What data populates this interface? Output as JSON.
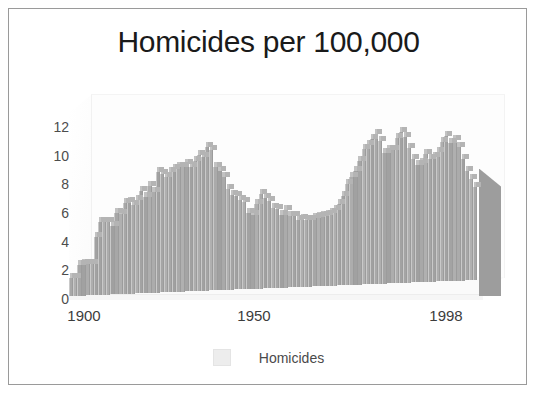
{
  "chart_data": {
    "type": "bar",
    "title": "Homicides per 100,000",
    "xlabel": "",
    "ylabel": "",
    "ylim": [
      0,
      13
    ],
    "yticks": [
      0,
      2,
      4,
      6,
      8,
      10,
      12
    ],
    "xticks": [
      "1900",
      "1950",
      "1998"
    ],
    "grid": false,
    "legend": {
      "position": "bottom",
      "entries": [
        "Homicides"
      ]
    },
    "style": "3d-bar",
    "bar_color": "#ababab",
    "bar_top_color": "#c2c2c2",
    "legend_swatch_color": "#ededed",
    "title_color": "#1a1a1a",
    "axis_text_color": "#4d4d4d",
    "frame_color": "#9a9a9a",
    "series": [
      {
        "name": "Homicides",
        "x": [
          1900,
          1901,
          1902,
          1903,
          1904,
          1905,
          1906,
          1907,
          1908,
          1909,
          1910,
          1911,
          1912,
          1913,
          1914,
          1915,
          1916,
          1917,
          1918,
          1919,
          1920,
          1921,
          1922,
          1923,
          1924,
          1925,
          1926,
          1927,
          1928,
          1929,
          1930,
          1931,
          1932,
          1933,
          1934,
          1935,
          1936,
          1937,
          1938,
          1939,
          1940,
          1941,
          1942,
          1943,
          1944,
          1945,
          1946,
          1947,
          1948,
          1949,
          1950,
          1951,
          1952,
          1953,
          1954,
          1955,
          1956,
          1957,
          1958,
          1959,
          1960,
          1961,
          1962,
          1963,
          1964,
          1965,
          1966,
          1967,
          1968,
          1969,
          1970,
          1971,
          1972,
          1973,
          1974,
          1975,
          1976,
          1977,
          1978,
          1979,
          1980,
          1981,
          1982,
          1983,
          1984,
          1985,
          1986,
          1987,
          1988,
          1989,
          1990,
          1991,
          1992,
          1993,
          1994,
          1995,
          1996,
          1997,
          1998
        ],
        "values": [
          1.2,
          1.2,
          2.1,
          2.1,
          2.1,
          2.1,
          3.9,
          4.9,
          4.9,
          4.9,
          4.6,
          5.5,
          5.4,
          6.1,
          6.2,
          6.0,
          6.3,
          6.9,
          6.5,
          7.2,
          6.8,
          8.1,
          8.0,
          7.8,
          8.1,
          8.3,
          8.4,
          8.4,
          8.6,
          8.4,
          8.8,
          9.2,
          9.0,
          9.7,
          9.5,
          8.3,
          8.0,
          7.6,
          6.8,
          6.4,
          6.3,
          6.0,
          5.9,
          5.1,
          5.0,
          5.7,
          6.4,
          6.1,
          5.9,
          5.4,
          5.3,
          4.9,
          5.2,
          4.8,
          4.8,
          4.5,
          4.6,
          4.5,
          4.5,
          4.6,
          4.7,
          4.7,
          4.8,
          4.9,
          5.1,
          5.5,
          6.0,
          6.8,
          7.3,
          7.7,
          8.3,
          9.1,
          9.4,
          9.8,
          10.1,
          9.6,
          8.8,
          9.0,
          9.0,
          9.8,
          10.2,
          9.8,
          9.1,
          8.3,
          7.9,
          8.0,
          8.6,
          8.3,
          8.4,
          8.7,
          9.4,
          9.8,
          9.3,
          9.5,
          9.0,
          8.2,
          7.4,
          6.8,
          6.3
        ]
      }
    ]
  },
  "legend": {
    "label": "Homicides"
  },
  "axes": {
    "y_labels": [
      "12",
      "10",
      "8",
      "6",
      "4",
      "2",
      "0"
    ],
    "x_labels": [
      "1900",
      "1950",
      "1998"
    ]
  },
  "title": "Homicides per 100,000"
}
